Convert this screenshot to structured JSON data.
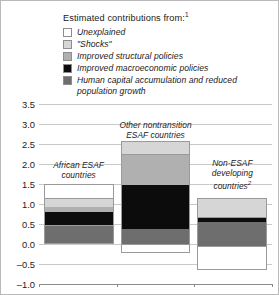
{
  "legend": {
    "title": "Estimated contributions from:",
    "title_footnote": "1",
    "items": [
      {
        "label": "Unexplained",
        "color": "#ffffff",
        "key": "unexplained"
      },
      {
        "label": "\"Shocks\"",
        "color": "#d6d6d6",
        "key": "shocks"
      },
      {
        "label": "Improved structural policies",
        "color": "#b0b0b0",
        "key": "structural"
      },
      {
        "label": "Improved macroeconomic policies",
        "color": "#0c0c0c",
        "key": "macro"
      },
      {
        "label": "Human capital accumulation and reduced population growth",
        "color": "#6e6e6e",
        "key": "human_capital"
      }
    ]
  },
  "axis": {
    "ylabels": [
      "3.5",
      "3.0",
      "2.5",
      "2.0",
      "1.5",
      "1.0",
      "0.5",
      "0.0",
      "–0.5",
      "–1.0"
    ],
    "yvalues": [
      3.5,
      3.0,
      2.5,
      2.0,
      1.5,
      1.0,
      0.5,
      0.0,
      -0.5,
      -1.0
    ],
    "ymin": -1.0,
    "ymax": 3.5
  },
  "bar_captions": [
    {
      "lines": [
        "African ESAF",
        "countries"
      ],
      "footnote": ""
    },
    {
      "lines": [
        "Other nontransition",
        "ESAF countries"
      ],
      "footnote": ""
    },
    {
      "lines": [
        "Non-ESAF",
        "developing",
        "countries"
      ],
      "footnote": "2"
    }
  ],
  "chart_data": {
    "type": "bar",
    "subtype": "stacked-bar-with-negatives",
    "title": "Estimated contributions from:",
    "xlabel": "",
    "ylabel": "",
    "ylim": [
      -1.0,
      3.5
    ],
    "ytick_step": 0.5,
    "grid": true,
    "legend_position": "top",
    "categories": [
      "African ESAF countries",
      "Other nontransition ESAF countries",
      "Non-ESAF developing countries"
    ],
    "series": [
      {
        "name": "Human capital accumulation and reduced population growth",
        "color": "#6e6e6e",
        "values": [
          0.47,
          0.38,
          0.6
        ]
      },
      {
        "name": "Improved macroeconomic policies",
        "color": "#0c0c0c",
        "values": [
          0.34,
          1.09,
          0.1
        ]
      },
      {
        "name": "Improved structural policies",
        "color": "#b0b0b0",
        "values": [
          0.11,
          0.75,
          0.0
        ]
      },
      {
        "name": "\"Shocks\"",
        "color": "#d6d6d6",
        "values": [
          0.2,
          0.35,
          0.5
        ]
      },
      {
        "name": "Unexplained",
        "color": "#ffffff",
        "values": [
          0.38,
          -0.22,
          -0.6
        ]
      }
    ],
    "segments": [
      [
        {
          "key": "human_capital",
          "from": 0.0,
          "to": 0.47,
          "color": "#6e6e6e"
        },
        {
          "key": "macro",
          "from": 0.47,
          "to": 0.81,
          "color": "#0c0c0c"
        },
        {
          "key": "structural",
          "from": 0.81,
          "to": 0.92,
          "color": "#b0b0b0"
        },
        {
          "key": "shocks",
          "from": 0.92,
          "to": 1.12,
          "color": "#d6d6d6"
        },
        {
          "key": "unexplained",
          "from": 1.12,
          "to": 1.5,
          "color": "#ffffff"
        }
      ],
      [
        {
          "key": "unexplained",
          "from": -0.22,
          "to": 0.0,
          "color": "#ffffff"
        },
        {
          "key": "human_capital",
          "from": 0.0,
          "to": 0.38,
          "color": "#6e6e6e"
        },
        {
          "key": "macro",
          "from": 0.38,
          "to": 1.47,
          "color": "#0c0c0c"
        },
        {
          "key": "structural",
          "from": 1.47,
          "to": 2.22,
          "color": "#b0b0b0"
        },
        {
          "key": "shocks",
          "from": 2.22,
          "to": 2.57,
          "color": "#d6d6d6"
        }
      ],
      [
        {
          "key": "unexplained",
          "from": -0.65,
          "to": -0.05,
          "color": "#ffffff"
        },
        {
          "key": "human_capital",
          "from": -0.05,
          "to": 0.55,
          "color": "#6e6e6e"
        },
        {
          "key": "macro",
          "from": 0.55,
          "to": 0.65,
          "color": "#0c0c0c"
        },
        {
          "key": "shocks",
          "from": 0.65,
          "to": 1.15,
          "color": "#d6d6d6"
        }
      ]
    ],
    "bar_x_centers_pct": [
      17,
      50,
      83
    ],
    "bar_width_pct": 30
  }
}
